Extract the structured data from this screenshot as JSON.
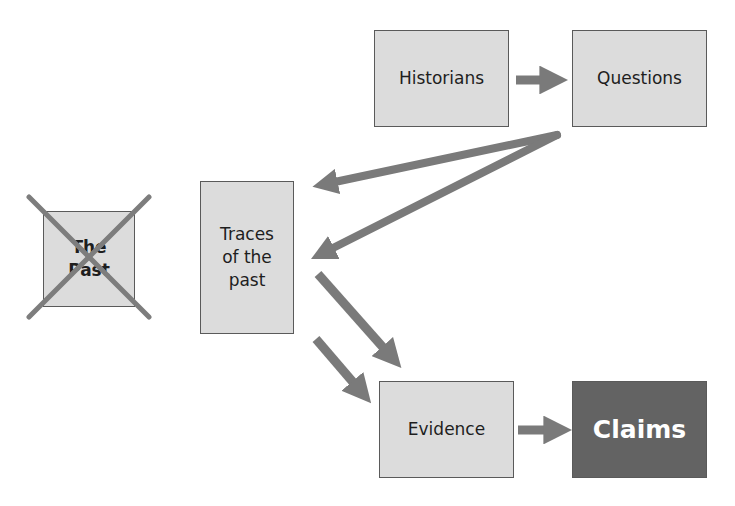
{
  "diagram": {
    "nodes": [
      {
        "id": "the_past",
        "label": "The\nPast",
        "crossed_out": true
      },
      {
        "id": "traces",
        "label": "Traces\nof the\npast"
      },
      {
        "id": "historians",
        "label": "Historians"
      },
      {
        "id": "questions",
        "label": "Questions"
      },
      {
        "id": "evidence",
        "label": "Evidence"
      },
      {
        "id": "claims",
        "label": "Claims",
        "emphasized": true
      }
    ],
    "edges": [
      {
        "from": "historians",
        "to": "questions"
      },
      {
        "from": "questions",
        "to": "traces"
      },
      {
        "from": "questions",
        "to": "traces"
      },
      {
        "from": "traces",
        "to": "evidence"
      },
      {
        "from": "traces",
        "to": "evidence"
      },
      {
        "from": "evidence",
        "to": "claims"
      }
    ],
    "colors": {
      "box_fill": "#dcdcdc",
      "box_border": "#5a5a5a",
      "arrow": "#7a7a7a",
      "claims_fill": "#636363",
      "cross": "#7d7d7d"
    }
  }
}
